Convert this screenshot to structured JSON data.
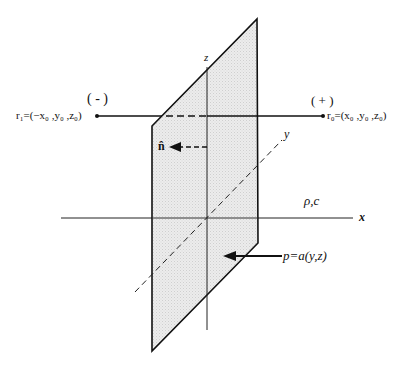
{
  "diagram": {
    "axes": {
      "x_label": "x",
      "y_label": "y",
      "z_label": "z"
    },
    "points": {
      "left": {
        "sign": "( - )",
        "label": "r₁=(−x₀ ,y₀ ,z₀)"
      },
      "right": {
        "sign": "( + )",
        "label": "r₀=(x₀ ,y₀ ,z₀)"
      }
    },
    "normal_label": "n̂",
    "medium_label": "ρ,c",
    "pressure_label": "p=a(y,z)",
    "colors": {
      "plane_fill": "#e6e6e6",
      "line": "#111111"
    }
  }
}
